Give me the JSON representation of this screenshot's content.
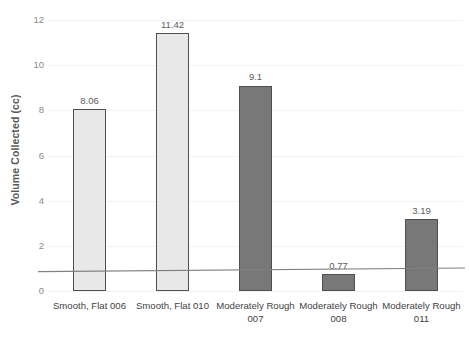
{
  "chart_data": {
    "type": "bar",
    "title": "",
    "xlabel": "",
    "ylabel": "Volume Collected (cc)",
    "ylim": [
      0,
      12
    ],
    "ytick_labels": [
      "0",
      "2",
      "4",
      "6",
      "8",
      "10",
      "12"
    ],
    "ytick_values": [
      0,
      2,
      4,
      6,
      8,
      10,
      12
    ],
    "grid": true,
    "legend": "none",
    "categories": [
      "Smooth, Flat 006",
      "Smooth, Flat 010",
      "Moderately Rough 007",
      "Moderately Rough 008",
      "Moderately Rough 011"
    ],
    "values": [
      8.06,
      11.42,
      9.1,
      0.77,
      3.19
    ],
    "value_labels": [
      "8.06",
      "11.42",
      "9.1",
      "0.77",
      "3.19"
    ],
    "bar_colors": [
      "#e8e8e8",
      "#e8e8e8",
      "#787878",
      "#787878",
      "#787878"
    ],
    "bar_border_color": "#4f4f4f",
    "annotations": [
      {
        "name": "reference-line",
        "type": "line",
        "color": "#808080",
        "y_left": 0.86,
        "y_right": 1.02
      }
    ]
  },
  "colors": {
    "light_bar": "#e8e8e8",
    "dark_bar": "#787878",
    "bar_border": "#4f4f4f",
    "gridline": "#f2f2f2",
    "tick_text": "#8a8a8a",
    "axis_title_text": "#5a5a5a",
    "category_text": "#3f3f3f",
    "reference_line": "#808080",
    "background": "#ffffff"
  }
}
